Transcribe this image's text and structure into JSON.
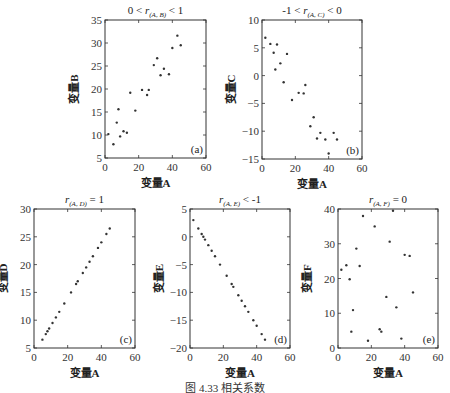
{
  "figure_caption": "图 4.33  相关系数",
  "chart_data": [
    {
      "type": "scatter",
      "panel_tag": "(a)",
      "title": "0 < r(A, B) < 1",
      "xlabel": "变量A",
      "ylabel": "变量B",
      "xlim": [
        0,
        60
      ],
      "ylim": [
        5,
        35
      ],
      "xticks": [
        0,
        20,
        40,
        60
      ],
      "yticks": [
        5,
        10,
        15,
        20,
        25,
        30,
        35
      ],
      "x": [
        2,
        5,
        7,
        8,
        9,
        11,
        13,
        15,
        18,
        22,
        25,
        26,
        29,
        31,
        33,
        35,
        38,
        40,
        43,
        45
      ],
      "y": [
        10.2,
        8,
        12.7,
        15.6,
        9.7,
        10.8,
        10.5,
        19.2,
        15.3,
        19.8,
        18.7,
        19.8,
        25.2,
        26.7,
        23,
        24.4,
        23.2,
        28.9,
        31.6,
        29.5
      ]
    },
    {
      "type": "scatter",
      "panel_tag": "(b)",
      "title": "-1 < r(A, C) < 0",
      "xlabel": "变量A",
      "ylabel": "变量C",
      "xlim": [
        0,
        60
      ],
      "ylim": [
        -15,
        10
      ],
      "xticks": [
        0,
        20,
        40,
        60
      ],
      "yticks": [
        -15,
        -10,
        -5,
        0,
        5,
        10
      ],
      "x": [
        2,
        5,
        7,
        8,
        9,
        11,
        13,
        15,
        18,
        22,
        25,
        26,
        29,
        31,
        33,
        35,
        38,
        40,
        43,
        45
      ],
      "y": [
        6.8,
        5.7,
        4.1,
        1.1,
        5.6,
        2.2,
        -1.2,
        3.9,
        -4.4,
        -3.1,
        -3.2,
        -1.7,
        -9.1,
        -7.5,
        -11.3,
        -10.3,
        -11.5,
        -14.0,
        -10.3,
        -11.5
      ]
    },
    {
      "type": "scatter",
      "panel_tag": "(c)",
      "title": "r(A, D) = 1",
      "xlabel": "变量A",
      "ylabel": "变量D",
      "xlim": [
        0,
        60
      ],
      "ylim": [
        5,
        30
      ],
      "xticks": [
        0,
        20,
        40,
        60
      ],
      "yticks": [
        5,
        10,
        15,
        20,
        25,
        30
      ],
      "x": [
        5,
        7,
        8,
        9,
        11,
        13,
        15,
        18,
        22,
        25,
        26,
        29,
        31,
        33,
        35,
        38,
        40,
        43,
        45
      ],
      "y": [
        6.5,
        7.5,
        8,
        8.5,
        9.5,
        10.5,
        11.5,
        13,
        15,
        16.5,
        17,
        18.5,
        19.5,
        20.5,
        21.5,
        23,
        24,
        25.5,
        26.5
      ]
    },
    {
      "type": "scatter",
      "panel_tag": "(d)",
      "title": "r(A, E) < -1",
      "xlabel": "变量A",
      "ylabel": "变量E",
      "xlim": [
        0,
        60
      ],
      "ylim": [
        -20,
        5
      ],
      "xticks": [
        0,
        20,
        40,
        60
      ],
      "yticks": [
        -20,
        -15,
        -10,
        -5,
        0,
        5
      ],
      "x": [
        2,
        5,
        7,
        8,
        9,
        11,
        13,
        15,
        18,
        22,
        25,
        26,
        29,
        31,
        33,
        35,
        38,
        40,
        43,
        45
      ],
      "y": [
        3,
        1.5,
        0.5,
        0,
        -0.5,
        -1.5,
        -2.5,
        -3.5,
        -5,
        -7,
        -8.5,
        -9,
        -10.5,
        -11.5,
        -12.5,
        -13.5,
        -15,
        -16,
        -17.5,
        -18.5
      ]
    },
    {
      "type": "scatter",
      "panel_tag": "(e)",
      "title": "r(A, F) = 0",
      "xlabel": "变量A",
      "ylabel": "变量F",
      "xlim": [
        0,
        60
      ],
      "ylim": [
        0,
        40
      ],
      "xticks": [
        0,
        20,
        40,
        60
      ],
      "yticks": [
        0,
        10,
        20,
        30,
        40
      ],
      "x": [
        2,
        5,
        7,
        8,
        9,
        11,
        13,
        15,
        18,
        22,
        25,
        26,
        29,
        31,
        33,
        35,
        38,
        40,
        43,
        45
      ],
      "y": [
        22.5,
        23.8,
        19.8,
        4.7,
        10.9,
        28.6,
        23.6,
        38,
        2.1,
        35,
        5.4,
        4.7,
        14.7,
        30.6,
        39.5,
        11.7,
        2.7,
        26.8,
        26.5,
        16
      ]
    }
  ]
}
